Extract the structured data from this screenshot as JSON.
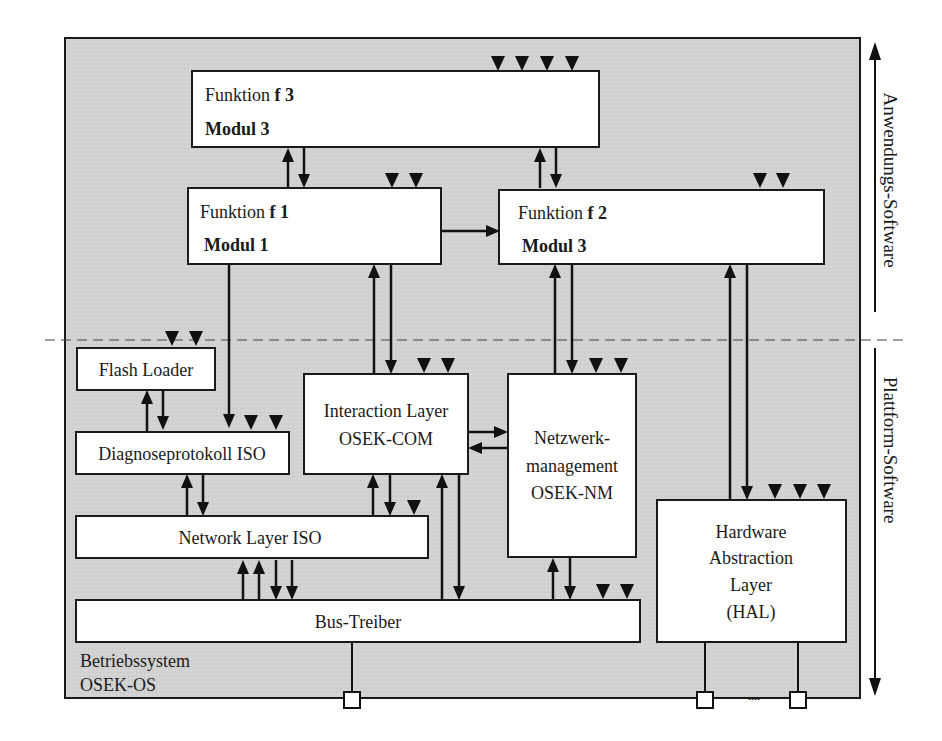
{
  "diagram": {
    "layers": {
      "application": "Anwendungs-Software",
      "platform": "Plattform-Software"
    },
    "os": {
      "line1": "Betriebssystem",
      "line2": "OSEK-OS"
    },
    "blocks": {
      "f3": {
        "funktion": "Funktion ",
        "f": "f 3",
        "modul": "Modul 3"
      },
      "f1": {
        "funktion": "Funktion ",
        "f": "f 1",
        "modul": "Modul 1"
      },
      "f2": {
        "funktion": "Funktion ",
        "f": "f 2",
        "modul": "Modul 3"
      },
      "flash_loader": "Flash Loader",
      "diag": "Diagnoseprotokoll ISO",
      "interaction": {
        "line1": "Interaction Layer",
        "line2": "OSEK-COM"
      },
      "nm": {
        "line1": "Netzwerk-",
        "line2": "management",
        "line3": "OSEK-NM"
      },
      "network": "Network Layer ISO",
      "bus": "Bus-Treiber",
      "hal": {
        "line1": "Hardware",
        "line2": "Abstraction",
        "line3": "Layer",
        "line4": "(HAL)"
      }
    },
    "pin_ellipsis": "....",
    "colors": {
      "background": "#d4d4d4",
      "box": "#ffffff",
      "stroke": "#1a1a1a"
    }
  }
}
